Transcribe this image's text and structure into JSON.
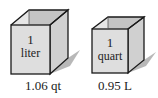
{
  "diagram": {
    "cubes": [
      {
        "label_line1": "1",
        "label_line2": "liter",
        "caption": "1.06 qt"
      },
      {
        "label_line1": "1",
        "label_line2": "quart",
        "caption": "0.95 L"
      }
    ],
    "colors": {
      "front_face": "#dedede",
      "side_face": "#d0d0d0",
      "inner_back": "#c4c4c4",
      "inner_side": "#e6e6e6",
      "edge": "#1a1a1a",
      "shadow": "#9a9a9a"
    }
  }
}
